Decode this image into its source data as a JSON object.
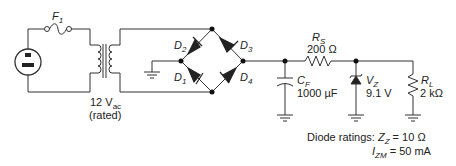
{
  "diagram": {
    "type": "circuit-schematic",
    "fuse": {
      "label": "F",
      "sub": "1"
    },
    "transformer": {
      "voltage": "12 V",
      "voltage_sub": "ac",
      "note": "(rated)"
    },
    "diodes": [
      {
        "label": "D",
        "sub": "2"
      },
      {
        "label": "D",
        "sub": "3"
      },
      {
        "label": "D",
        "sub": "1"
      },
      {
        "label": "D",
        "sub": "4"
      }
    ],
    "capacitor": {
      "label": "C",
      "sub": "F",
      "value": "1000 µF"
    },
    "series_resistor": {
      "label": "R",
      "sub": "S",
      "value": "200 Ω"
    },
    "zener": {
      "label": "V",
      "sub": "Z",
      "value": "9.1 V"
    },
    "load_resistor": {
      "label": "R",
      "sub": "L",
      "value": "2 kΩ"
    },
    "ratings": {
      "prefix": "Diode ratings:",
      "zz_label": "Z",
      "zz_sub": "Z",
      "zz_value": " = 10 Ω",
      "izm_label": "I",
      "izm_sub": "ZM",
      "izm_value": " = 50 mA"
    }
  }
}
